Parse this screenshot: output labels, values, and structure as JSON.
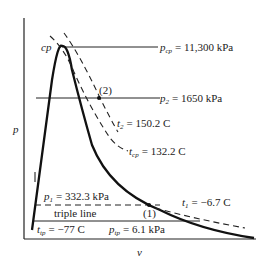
{
  "diagram": {
    "type": "p-v phase diagram",
    "axes": {
      "y_label": "p",
      "x_label": "v"
    },
    "critical_point": {
      "label": "cp",
      "pressure_label": "p",
      "pressure_sub": "cp",
      "pressure_value": "= 11,300 kPa"
    },
    "state2": {
      "marker": "(2)",
      "pressure_label": "p",
      "pressure_sub": "2",
      "pressure_value": "= 1650 kPa"
    },
    "isotherm_t2": {
      "label": "t",
      "sub": "2",
      "value": "= 150.2 C"
    },
    "isotherm_tcp": {
      "label": "t",
      "sub": "cp",
      "value": "= 132.2 C"
    },
    "state1": {
      "marker": "(1)",
      "pressure_label": "p",
      "pressure_sub": "1",
      "pressure_value": "= 332.3 kPa",
      "temp_label": "t",
      "temp_sub": "1",
      "temp_value": "= −6.7 C"
    },
    "triple_line": {
      "label": "triple line",
      "temp_label": "t",
      "temp_sub": "tp",
      "temp_value": "= −77 C",
      "pressure_label": "p",
      "pressure_sub": "tp",
      "pressure_value": "= 6.1 kPa"
    },
    "colors": {
      "ink": "#222222",
      "background": "#ffffff"
    }
  }
}
